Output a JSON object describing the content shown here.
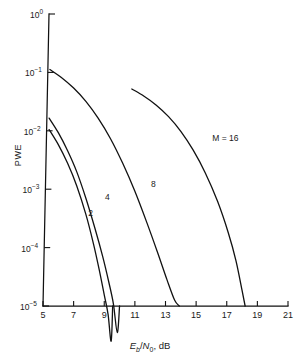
{
  "chart_data": {
    "type": "line",
    "title": "",
    "xlabel": "Eb/N0, dB",
    "ylabel": "PWE",
    "xlim": [
      5,
      21
    ],
    "ylim": [
      1e-05,
      1
    ],
    "yscale": "log",
    "grid": false,
    "legend_position": "inline-curve-labels",
    "xticks": [
      5,
      7,
      9,
      11,
      13,
      15,
      17,
      19,
      21
    ],
    "xtick_labels": [
      "5",
      "7",
      "9",
      "11",
      "13",
      "15",
      "17",
      "19",
      "21"
    ],
    "yticks": [
      1,
      0.1,
      0.01,
      0.001,
      0.0001,
      1e-05
    ],
    "ytick_labels": [
      "10^0",
      "10^-1",
      "10^-2",
      "10^-3",
      "10^-4",
      "10^-5"
    ],
    "series": [
      {
        "name": "2",
        "label": "2",
        "x": [
          5.4,
          6.0,
          6.6,
          7.2,
          7.8,
          8.3,
          8.7,
          9.0,
          9.25,
          9.45,
          9.55
        ],
        "y": [
          0.0105,
          0.0058,
          0.0028,
          0.00115,
          0.00037,
          0.000115,
          3.85e-05,
          1.55e-05,
          7.2e-06,
          2.5e-06,
          1e-05
        ]
      },
      {
        "name": "4",
        "label": "4",
        "x": [
          5.4,
          6.0,
          6.6,
          7.2,
          7.8,
          8.4,
          8.9,
          9.3,
          9.6,
          9.85,
          10.0
        ],
        "y": [
          0.0165,
          0.0093,
          0.0046,
          0.002,
          0.0007,
          0.00021,
          7e-05,
          2.55e-05,
          1.08e-05,
          3.5e-06,
          1e-05
        ]
      },
      {
        "name": "8",
        "label": "8",
        "x": [
          5.45,
          6.2,
          7.0,
          7.8,
          8.6,
          9.4,
          10.2,
          11.0,
          11.8,
          12.5,
          13.1,
          13.6,
          13.9
        ],
        "y": [
          0.112,
          0.082,
          0.054,
          0.032,
          0.0165,
          0.0074,
          0.0028,
          0.00092,
          0.00026,
          8e-05,
          2.8e-05,
          1.25e-05,
          1e-05
        ]
      },
      {
        "name": "M = 16",
        "label": "M = 16",
        "x": [
          10.8,
          11.6,
          12.4,
          13.2,
          14.0,
          14.8,
          15.6,
          16.4,
          17.1,
          17.6,
          18.0,
          18.2
        ],
        "y": [
          0.052,
          0.039,
          0.0275,
          0.0175,
          0.0098,
          0.0047,
          0.0019,
          0.00062,
          0.00018,
          6e-05,
          1.85e-05,
          1e-05
        ]
      }
    ],
    "curve_labels": [
      {
        "text": "2",
        "x": 7.95,
        "y": 0.00038
      },
      {
        "text": "4",
        "x": 9.05,
        "y": 0.00072
      },
      {
        "text": "8",
        "x": 12.05,
        "y": 0.0012
      },
      {
        "text": "M = 16",
        "x": 16.05,
        "y": 0.0072
      }
    ],
    "line_color": "#111111"
  }
}
